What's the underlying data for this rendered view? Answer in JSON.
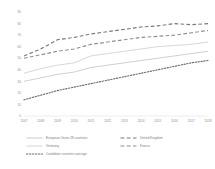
{
  "chart_data": {
    "type": "line",
    "title": "",
    "subtitle": "",
    "xlabel": "",
    "ylabel": "",
    "x": [
      "2007",
      "2008",
      "2009",
      "2010",
      "2011",
      "2012",
      "2013",
      "2014",
      "2015",
      "2016",
      "2017",
      "2018"
    ],
    "xlim": [
      2007,
      2018
    ],
    "ylim": [
      0,
      90
    ],
    "yticks": [
      "90",
      "80",
      "70",
      "60",
      "50",
      "40",
      "30",
      "20",
      "10",
      "0"
    ],
    "ytick_values": [
      90,
      80,
      70,
      60,
      50,
      40,
      30,
      20,
      10,
      0
    ],
    "grid": false,
    "legend_position": "bottom",
    "series": [
      {
        "name": "European Union 28 countries",
        "style": "solid",
        "color": "#bfbfbf",
        "values": [
          30,
          33,
          36,
          38,
          42,
          44,
          46,
          48,
          50,
          52,
          54,
          56
        ]
      },
      {
        "name": "United Kingdom",
        "style": "dashed",
        "color": "#7a7a7a",
        "values": [
          52,
          58,
          66,
          68,
          71,
          73,
          75,
          77,
          78,
          80,
          79,
          80
        ]
      },
      {
        "name": "Germany",
        "style": "solid",
        "color": "#c9c9c9",
        "values": [
          37,
          41,
          44,
          46,
          52,
          54,
          56,
          58,
          60,
          61,
          62,
          64
        ]
      },
      {
        "name": "France",
        "style": "dashed",
        "color": "#8f8f8f",
        "values": [
          50,
          53,
          56,
          58,
          62,
          64,
          66,
          68,
          69,
          70,
          72,
          74
        ]
      },
      {
        "name": "Candidate countries average",
        "style": "dotted",
        "color": "#6e6e6e",
        "values": [
          14,
          18,
          22,
          25,
          28,
          31,
          34,
          37,
          40,
          43,
          46,
          48
        ]
      }
    ]
  },
  "legend": {
    "items": [
      {
        "label": "European Union 28 countries",
        "style": "solid",
        "color": "#bfbfbf"
      },
      {
        "label": "United Kingdom",
        "style": "dashed",
        "color": "#7a7a7a"
      },
      {
        "label": "Germany",
        "style": "solid",
        "color": "#c9c9c9"
      },
      {
        "label": "France",
        "style": "dashed",
        "color": "#8f8f8f"
      },
      {
        "label": "Candidate countries average",
        "style": "dotted",
        "color": "#6e6e6e"
      }
    ]
  }
}
